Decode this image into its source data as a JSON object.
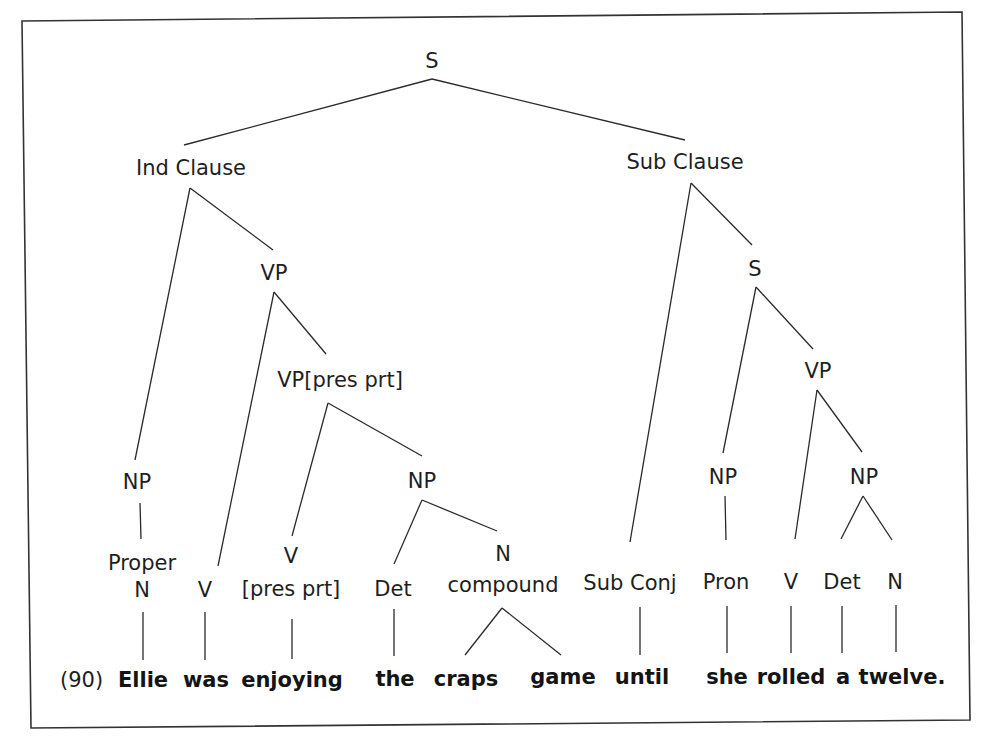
{
  "example_number": "(90)",
  "sentence": "Ellie was enjoying the craps game until she rolled a twelve.",
  "nodes": {
    "root": "S",
    "ind_clause": "Ind Clause",
    "sub_clause": "Sub Clause",
    "vp_main": "VP",
    "vp_pres_prt": "VP[pres prt]",
    "np_subject": "NP",
    "np_object": "NP",
    "proper_n_line1": "Proper",
    "proper_n_line2": "N",
    "v_was": "V",
    "v_pres_line1": "V",
    "v_pres_line2": "[pres prt]",
    "det_the": "Det",
    "n_compound_line1": "N",
    "n_compound_line2": "compound",
    "sub_conj": "Sub Conj",
    "s_sub": "S",
    "vp_sub": "VP",
    "np_pron": "NP",
    "np_sub_object": "NP",
    "pron": "Pron",
    "v_rolled": "V",
    "det_a": "Det",
    "n_twelve": "N"
  },
  "words": {
    "ellie": "Ellie",
    "was": "was",
    "enjoying": "enjoying",
    "the": "the",
    "craps": "craps",
    "game": "game",
    "until": "until",
    "she": "she",
    "rolled": "rolled",
    "a": "a",
    "twelve": "twelve."
  }
}
